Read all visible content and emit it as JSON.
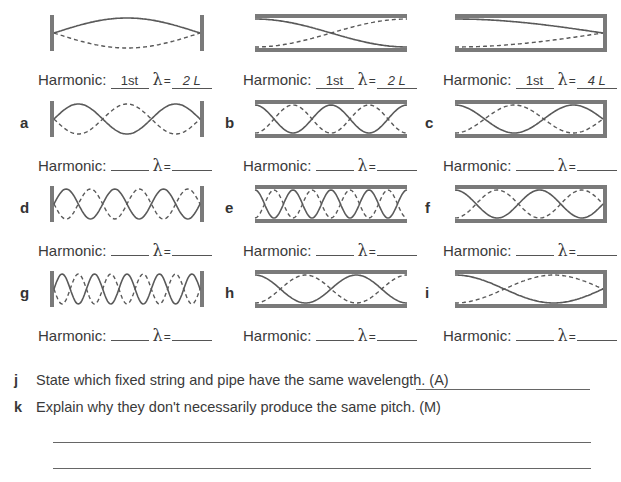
{
  "colors": {
    "wave": "#5a5a5a",
    "frame": "#7a7a7a",
    "text": "#3a3a3a"
  },
  "labels": {
    "harmonic": "Harmonic:",
    "lambda": "λ",
    "equals": "="
  },
  "examples": [
    {
      "id": "ex-string",
      "type": "string",
      "half_waves": 1,
      "harmonic": "1st",
      "wavelength": "2 L"
    },
    {
      "id": "ex-open-pipe",
      "type": "open",
      "half_waves": 1,
      "harmonic": "1st",
      "wavelength": "2 L"
    },
    {
      "id": "ex-closed-pipe",
      "type": "closed",
      "quarter_waves": 1,
      "harmonic": "1st",
      "wavelength": "4 L"
    }
  ],
  "exercises": [
    {
      "letter": "a",
      "type": "string",
      "half_waves": 3,
      "harmonic": "",
      "wavelength": ""
    },
    {
      "letter": "b",
      "type": "open",
      "half_waves": 4,
      "harmonic": "",
      "wavelength": ""
    },
    {
      "letter": "c",
      "type": "closed",
      "quarter_waves": 5,
      "harmonic": "",
      "wavelength": ""
    },
    {
      "letter": "d",
      "type": "string",
      "half_waves": 6,
      "harmonic": "",
      "wavelength": ""
    },
    {
      "letter": "e",
      "type": "open",
      "half_waves": 8,
      "harmonic": "",
      "wavelength": ""
    },
    {
      "letter": "f",
      "type": "closed",
      "quarter_waves": 7,
      "harmonic": "",
      "wavelength": ""
    },
    {
      "letter": "g",
      "type": "string",
      "half_waves": 9,
      "harmonic": "",
      "wavelength": ""
    },
    {
      "letter": "h",
      "type": "open",
      "half_waves": 3,
      "harmonic": "",
      "wavelength": ""
    },
    {
      "letter": "i",
      "type": "closed",
      "quarter_waves": 3,
      "harmonic": "",
      "wavelength": ""
    }
  ],
  "questions": [
    {
      "letter": "j",
      "text": "State which fixed string and pipe have the same wavelength. (A)"
    },
    {
      "letter": "k",
      "text": "Explain why they don't necessarily produce the same pitch. (M)"
    }
  ]
}
